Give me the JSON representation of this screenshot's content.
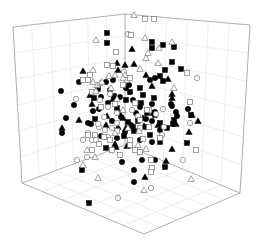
{
  "chart_data": {
    "type": "scatter",
    "subtype": "3d-scatter",
    "title": "",
    "xlabel": "",
    "ylabel": "",
    "zlabel": "",
    "grid": true,
    "legend": null,
    "box": {
      "top_left": [
        13,
        27
      ],
      "top_back": [
        125,
        14
      ],
      "top_right": [
        250,
        25
      ],
      "bottom_left": [
        22,
        183
      ],
      "bottom_back": [
        125,
        145
      ],
      "bottom_front": [
        144,
        234
      ],
      "bottom_right": [
        240,
        193
      ],
      "grid_divisions": 6
    },
    "colors": {
      "filled": "#000000",
      "open_stroke": "#7a7a7a",
      "open_fill": "#ffffff"
    },
    "series": [
      {
        "name": "filled-circle",
        "marker": "circle",
        "filled": true,
        "points": [
          [
            61,
            91
          ],
          [
            79,
            82
          ],
          [
            106,
            82
          ],
          [
            113,
            80
          ],
          [
            110,
            90
          ],
          [
            126,
            88
          ],
          [
            120,
            97
          ],
          [
            101,
            97
          ],
          [
            108,
            103
          ],
          [
            133,
            100
          ],
          [
            140,
            107
          ],
          [
            152,
            104
          ],
          [
            171,
            104
          ],
          [
            176,
            112
          ],
          [
            155,
            112
          ],
          [
            146,
            119
          ],
          [
            136,
            113
          ],
          [
            131,
            125
          ],
          [
            121,
            117
          ],
          [
            112,
            121
          ],
          [
            99,
            109
          ],
          [
            88,
            123
          ],
          [
            66,
            118
          ],
          [
            62,
            133
          ],
          [
            91,
            124
          ],
          [
            125,
            132
          ],
          [
            152,
            121
          ],
          [
            172,
            106
          ],
          [
            188,
            109
          ],
          [
            177,
            116
          ],
          [
            134,
            170
          ],
          [
            122,
            162
          ],
          [
            152,
            142
          ],
          [
            142,
            160
          ],
          [
            117,
            138
          ],
          [
            155,
            78
          ],
          [
            150,
            80
          ],
          [
            129,
            85
          ],
          [
            93,
            111
          ],
          [
            101,
            136
          ],
          [
            74,
            105
          ],
          [
            140,
            140
          ],
          [
            160,
            130
          ],
          [
            134,
            182
          ],
          [
            155,
            160
          ]
        ]
      },
      {
        "name": "filled-square",
        "marker": "square",
        "filled": true,
        "points": [
          [
            107,
            33
          ],
          [
            107,
            43
          ],
          [
            152,
            42
          ],
          [
            163,
            45
          ],
          [
            174,
            47
          ],
          [
            152,
            48
          ],
          [
            172,
            62
          ],
          [
            165,
            70
          ],
          [
            181,
            69
          ],
          [
            160,
            76
          ],
          [
            163,
            81
          ],
          [
            140,
            88
          ],
          [
            143,
            95
          ],
          [
            130,
            92
          ],
          [
            126,
            100
          ],
          [
            141,
            103
          ],
          [
            154,
            98
          ],
          [
            155,
            115
          ],
          [
            174,
            120
          ],
          [
            160,
            123
          ],
          [
            191,
            115
          ],
          [
            173,
            124
          ],
          [
            187,
            143
          ],
          [
            160,
            142
          ],
          [
            165,
            167
          ],
          [
            82,
            170
          ],
          [
            106,
            148
          ],
          [
            124,
            136
          ],
          [
            117,
            108
          ],
          [
            119,
            113
          ],
          [
            146,
            127
          ],
          [
            128,
            122
          ],
          [
            133,
            127
          ],
          [
            150,
            135
          ],
          [
            134,
            131
          ],
          [
            89,
            203
          ],
          [
            147,
            113
          ],
          [
            138,
            121
          ],
          [
            98,
            89
          ],
          [
            114,
            96
          ],
          [
            94,
            98
          ],
          [
            95,
            119
          ],
          [
            167,
            128
          ]
        ]
      },
      {
        "name": "filled-triangle",
        "marker": "triangle",
        "filled": true,
        "points": [
          [
            132,
            49
          ],
          [
            134,
            64
          ],
          [
            125,
            65
          ],
          [
            118,
            70
          ],
          [
            146,
            75
          ],
          [
            168,
            79
          ],
          [
            172,
            98
          ],
          [
            176,
            124
          ],
          [
            189,
            132
          ],
          [
            172,
            94
          ],
          [
            198,
            121
          ],
          [
            192,
            115
          ],
          [
            152,
            86
          ],
          [
            126,
            128
          ],
          [
            118,
            127
          ],
          [
            62,
            128
          ],
          [
            83,
            71
          ],
          [
            117,
            63
          ],
          [
            79,
            120
          ],
          [
            153,
            113
          ],
          [
            143,
            118
          ],
          [
            107,
            116
          ],
          [
            116,
            147
          ],
          [
            127,
            146
          ],
          [
            145,
            177
          ],
          [
            166,
            161
          ],
          [
            172,
            149
          ],
          [
            144,
            126
          ],
          [
            158,
            125
          ],
          [
            123,
            118
          ],
          [
            106,
            125
          ],
          [
            115,
            144
          ],
          [
            113,
            99
          ],
          [
            90,
            95
          ],
          [
            92,
            104
          ]
        ]
      },
      {
        "name": "open-circle",
        "marker": "circle",
        "filled": false,
        "points": [
          [
            128,
            34
          ],
          [
            124,
            72
          ],
          [
            76,
            99
          ],
          [
            108,
            107
          ],
          [
            117,
            113
          ],
          [
            104,
            117
          ],
          [
            112,
            128
          ],
          [
            99,
            127
          ],
          [
            88,
            133
          ],
          [
            108,
            137
          ],
          [
            117,
            123
          ],
          [
            132,
            110
          ],
          [
            138,
            116
          ],
          [
            156,
            114
          ],
          [
            163,
            109
          ],
          [
            162,
            135
          ],
          [
            164,
            127
          ],
          [
            183,
            160
          ],
          [
            151,
            188
          ],
          [
            118,
            198
          ],
          [
            197,
            78
          ],
          [
            190,
            123
          ],
          [
            77,
            160
          ],
          [
            87,
            157
          ],
          [
            83,
            140
          ],
          [
            92,
            140
          ],
          [
            96,
            140
          ],
          [
            98,
            124
          ],
          [
            105,
            130
          ],
          [
            100,
            100
          ],
          [
            110,
            94
          ]
        ]
      },
      {
        "name": "open-square",
        "marker": "square",
        "filled": false,
        "points": [
          [
            145,
            19
          ],
          [
            154,
            19
          ],
          [
            131,
            35
          ],
          [
            116,
            52
          ],
          [
            107,
            65
          ],
          [
            113,
            66
          ],
          [
            88,
            80
          ],
          [
            83,
            80
          ],
          [
            90,
            75
          ],
          [
            92,
            92
          ],
          [
            101,
            107
          ],
          [
            115,
            104
          ],
          [
            123,
            85
          ],
          [
            127,
            80
          ],
          [
            130,
            78
          ],
          [
            140,
            120
          ],
          [
            149,
            110
          ],
          [
            149,
            127
          ],
          [
            151,
            160
          ],
          [
            152,
            168
          ],
          [
            151,
            172
          ],
          [
            196,
            150
          ],
          [
            190,
            102
          ],
          [
            187,
            73
          ],
          [
            135,
            150
          ],
          [
            140,
            152
          ],
          [
            130,
            140
          ],
          [
            117,
            131
          ],
          [
            104,
            137
          ],
          [
            99,
            144
          ],
          [
            92,
            150
          ],
          [
            130,
            145
          ],
          [
            143,
            139
          ],
          [
            160,
            138
          ],
          [
            147,
            110
          ],
          [
            135,
            103
          ],
          [
            140,
            128
          ],
          [
            95,
            135
          ],
          [
            88,
            135
          ],
          [
            112,
            150
          ],
          [
            120,
            155
          ],
          [
            110,
            140
          ]
        ]
      },
      {
        "name": "open-triangle",
        "marker": "triangle",
        "filled": false,
        "points": [
          [
            134,
            15
          ],
          [
            96,
            40
          ],
          [
            145,
            38
          ],
          [
            148,
            53
          ],
          [
            159,
            48
          ],
          [
            172,
            42
          ],
          [
            146,
            58
          ],
          [
            158,
            63
          ],
          [
            93,
            70
          ],
          [
            93,
            82
          ],
          [
            97,
            85
          ],
          [
            96,
            91
          ],
          [
            100,
            83
          ],
          [
            109,
            76
          ],
          [
            115,
            75
          ],
          [
            125,
            75
          ],
          [
            140,
            69
          ],
          [
            123,
            78
          ],
          [
            111,
            88
          ],
          [
            123,
            110
          ],
          [
            115,
            133
          ],
          [
            139,
            131
          ],
          [
            98,
            178
          ],
          [
            144,
            190
          ],
          [
            191,
            179
          ],
          [
            83,
            165
          ],
          [
            95,
            157
          ],
          [
            87,
            150
          ],
          [
            102,
            82
          ],
          [
            174,
            88
          ],
          [
            138,
            145
          ],
          [
            146,
            149
          ],
          [
            128,
            128
          ],
          [
            117,
            99
          ]
        ]
      }
    ]
  }
}
